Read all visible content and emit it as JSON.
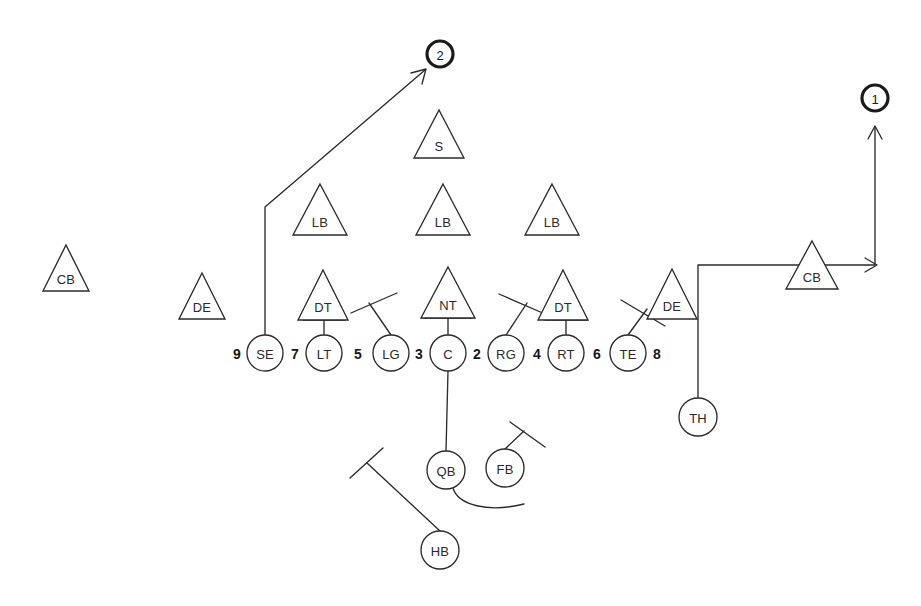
{
  "diagram": {
    "type": "offensive-formation-with-routes",
    "background_color": "#ffffff",
    "ink_color": "#2b2b2b",
    "width": 921,
    "height": 606
  },
  "defense": {
    "shape": "triangle",
    "players": [
      {
        "id": "cb-left",
        "label": "CB",
        "x": 66,
        "y": 268,
        "size": 46
      },
      {
        "id": "de-left",
        "label": "DE",
        "x": 202,
        "y": 296,
        "size": 46
      },
      {
        "id": "dt-left",
        "label": "DT",
        "x": 323,
        "y": 295,
        "size": 50
      },
      {
        "id": "nt",
        "label": "NT",
        "x": 448,
        "y": 294,
        "size": 54
      },
      {
        "id": "dt-right",
        "label": "DT",
        "x": 563,
        "y": 295,
        "size": 50
      },
      {
        "id": "de-right",
        "label": "DE",
        "x": 672,
        "y": 294,
        "size": 50
      },
      {
        "id": "lb-left",
        "label": "LB",
        "x": 320,
        "y": 210,
        "size": 54
      },
      {
        "id": "lb-mid",
        "label": "LB",
        "x": 443,
        "y": 210,
        "size": 54
      },
      {
        "id": "lb-right",
        "label": "LB",
        "x": 552,
        "y": 210,
        "size": 54
      },
      {
        "id": "safety",
        "label": "S",
        "x": 439,
        "y": 134,
        "size": 50
      },
      {
        "id": "cb-right",
        "label": "CB",
        "x": 812,
        "y": 264,
        "size": 50
      }
    ]
  },
  "offense": {
    "shape": "circle",
    "line_y": 353,
    "players": [
      {
        "id": "se",
        "label": "SE",
        "x": 265,
        "y": 353,
        "r": 18
      },
      {
        "id": "lt",
        "label": "LT",
        "x": 324,
        "y": 353,
        "r": 18
      },
      {
        "id": "lg",
        "label": "LG",
        "x": 391,
        "y": 353,
        "r": 18
      },
      {
        "id": "c",
        "label": "C",
        "x": 448,
        "y": 353,
        "r": 18
      },
      {
        "id": "rg",
        "label": "RG",
        "x": 506,
        "y": 353,
        "r": 18
      },
      {
        "id": "rt",
        "label": "RT",
        "x": 566,
        "y": 353,
        "r": 18
      },
      {
        "id": "te",
        "label": "TE",
        "x": 628,
        "y": 353,
        "r": 18
      },
      {
        "id": "qb",
        "label": "QB",
        "x": 446,
        "y": 470,
        "r": 19
      },
      {
        "id": "fb",
        "label": "FB",
        "x": 505,
        "y": 468,
        "r": 19
      },
      {
        "id": "hb",
        "label": "HB",
        "x": 440,
        "y": 550,
        "r": 19
      },
      {
        "id": "th",
        "label": "TH",
        "x": 698,
        "y": 417,
        "r": 19
      }
    ]
  },
  "gap_numbers": [
    {
      "id": "gap-9",
      "label": "9",
      "x": 237,
      "y": 353
    },
    {
      "id": "gap-7",
      "label": "7",
      "x": 295,
      "y": 353
    },
    {
      "id": "gap-5",
      "label": "5",
      "x": 358,
      "y": 353
    },
    {
      "id": "gap-3",
      "label": "3",
      "x": 419,
      "y": 353
    },
    {
      "id": "gap-2",
      "label": "2",
      "x": 477,
      "y": 353
    },
    {
      "id": "gap-4",
      "label": "4",
      "x": 537,
      "y": 353
    },
    {
      "id": "gap-6",
      "label": "6",
      "x": 597,
      "y": 353
    },
    {
      "id": "gap-8",
      "label": "8",
      "x": 657,
      "y": 353
    }
  ],
  "route_markers": [
    {
      "id": "marker-2",
      "label": "2",
      "x": 440,
      "y": 54,
      "r": 13
    },
    {
      "id": "marker-1",
      "label": "1",
      "x": 875,
      "y": 98,
      "r": 13
    }
  ],
  "routes": [
    {
      "id": "se-route",
      "from": "se",
      "to": "marker-2",
      "description": "SE releases vertical then breaks on a post/corner angle up-right to marker 2",
      "path": "M 265 335 L 265 207 L 425 70",
      "arrow": {
        "x": 425,
        "y": 70,
        "angle": -40
      }
    },
    {
      "id": "th-route",
      "from": "th",
      "to": "marker-1",
      "description": "TH runs up, crosses right behind the line past CB, then turns upfield to marker 1",
      "path": "M 698 398 L 698 265 L 875 265 L 875 127",
      "arrows": [
        {
          "x": 875,
          "y": 265,
          "angle": 0
        },
        {
          "x": 875,
          "y": 127,
          "angle": -90
        }
      ]
    },
    {
      "id": "qb-sweep",
      "from": "qb",
      "description": "QB reverse-pivot path curving right under the FB",
      "path": "M 453 488 C 458 505, 488 512, 523 505"
    }
  ],
  "assignments": [
    {
      "id": "c-to-qb",
      "description": "Center snap line to QB",
      "path": "M 448 371 L 446 451"
    },
    {
      "id": "lt-block",
      "description": "LT drive block on left DT",
      "path": "M 324 335 L 324 320",
      "bar": "M 303 320 L 345 320"
    },
    {
      "id": "c-block",
      "description": "Center drive block on NT",
      "path": "M 448 335 L 448 318",
      "bar": "M 424 318 L 472 318"
    },
    {
      "id": "rt-block",
      "description": "RT drive block on right DT",
      "path": "M 566 335 L 566 320",
      "bar": "M 545 320 L 587 320"
    },
    {
      "id": "lg-block",
      "description": "LG angle block up-left",
      "path": "M 391 335 L 369 303",
      "bar": "M 351 313 L 397 293"
    },
    {
      "id": "rg-block",
      "description": "RG angle block up-right",
      "path": "M 506 335 L 527 303",
      "bar": "M 499 294 L 545 314"
    },
    {
      "id": "te-block",
      "description": "TE angle block up-right on DE",
      "path": "M 628 335 L 647 309",
      "bar": "M 621 300 L 665 326"
    },
    {
      "id": "hb-block",
      "description": "HB lead block path to the left",
      "path": "M 440 531 L 367 463",
      "bar": "M 350 478 L 383 448"
    },
    {
      "id": "fb-block",
      "description": "FB block path up-right",
      "path": "M 505 449 L 524 431",
      "bar": "M 510 422 L 545 447"
    }
  ],
  "legend": {
    "offense_symbol": "circle",
    "defense_symbol": "triangle",
    "block_symbol": "line-with-crossbar",
    "route_symbol": "line-with-arrow"
  }
}
